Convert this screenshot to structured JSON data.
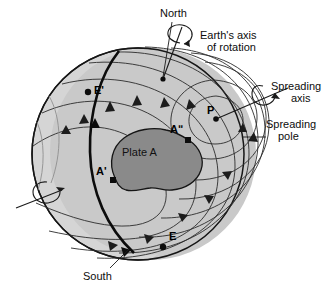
{
  "figure": {
    "background_color": "#ffffff",
    "sphere": {
      "fill_color": "#c9c9c9",
      "limb_color": "#cfcfcf",
      "outline_color": "#111111",
      "center_x": 138,
      "center_y": 154,
      "radius": 106
    },
    "plate": {
      "label": "Plate A",
      "fill_color": "#8a8a8a",
      "outline_color": "#111111"
    },
    "labels": {
      "north": "North",
      "south": "South",
      "earth_axis_line1": "Earth's axis",
      "earth_axis_line2": "of rotation",
      "spreading_axis_line1": "Spreading",
      "spreading_axis_line2": "axis",
      "spreading_pole_line1": "Spreading",
      "spreading_pole_line2": "pole"
    },
    "points": [
      {
        "id": "E-prime",
        "label": "E'",
        "marker": "dot",
        "x": 88,
        "y": 92
      },
      {
        "id": "A-double-prime",
        "label": "Aʺ",
        "marker": "square",
        "x": 188,
        "y": 140
      },
      {
        "id": "A-prime",
        "label": "A'",
        "marker": "square",
        "x": 113,
        "y": 180
      },
      {
        "id": "E",
        "label": "E",
        "marker": "dot",
        "x": 163,
        "y": 247
      },
      {
        "id": "P",
        "label": "P",
        "marker": "dot",
        "x": 216,
        "y": 119
      },
      {
        "id": "north-pole",
        "label": "",
        "marker": "dot",
        "x": 163,
        "y": 79
      }
    ],
    "icons": {
      "rotation_arrow_north": "rotation-arrow-icon",
      "rotation_arrow_south": "rotation-arrow-icon",
      "rotation_arrow_spreading": "rotation-arrow-icon"
    }
  }
}
